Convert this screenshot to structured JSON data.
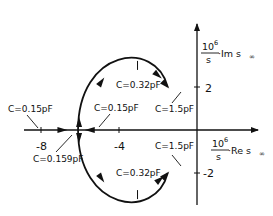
{
  "diagram": {
    "y_axis": {
      "numerator": "10",
      "exponent": "6",
      "denominator": "s",
      "label": "·Im s",
      "subscript": "∞"
    },
    "x_axis": {
      "numerator": "10",
      "exponent": "6",
      "denominator": "s",
      "label": "·Re s",
      "subscript": "∞"
    },
    "ticks": {
      "x": [
        {
          "value": -8,
          "label": "-8"
        },
        {
          "value": -4,
          "label": "-4"
        }
      ],
      "y": [
        {
          "value": 2,
          "label": "2"
        },
        {
          "value": -2,
          "label": "-2"
        }
      ]
    },
    "annotations": [
      {
        "id": "c015-left",
        "text": "C=0.15pF",
        "point": {
          "re": -7.6,
          "im": 0
        }
      },
      {
        "id": "c015-right",
        "text": "C=0.15pF",
        "point": {
          "re": -4.9,
          "im": 0
        }
      },
      {
        "id": "c0159",
        "text": "C=0.159pF",
        "point": {
          "re": -6.1,
          "im": 0
        }
      },
      {
        "id": "c032-top",
        "text": "C=0.32pF",
        "point": {
          "re": -3.0,
          "im": 3.2
        }
      },
      {
        "id": "c032-bottom",
        "text": "C=0.32pF",
        "point": {
          "re": -3.0,
          "im": -3.2
        }
      },
      {
        "id": "c15-top",
        "text": "C=1.5pF",
        "point": {
          "re": -1.5,
          "im": 2
        }
      },
      {
        "id": "c15-bottom",
        "text": "C=1.5pF",
        "point": {
          "re": -1.5,
          "im": -2
        }
      }
    ],
    "locus": {
      "real_branches": "two real poles approach from left and right, meet at breakaway point Re≈-6.1 (C=0.159pF)",
      "complex_branches": "split into conjugate pair, arc through Im=±3.2 at C=0.32pF, ending near (-1.5, ±2) at C=1.5pF"
    }
  }
}
